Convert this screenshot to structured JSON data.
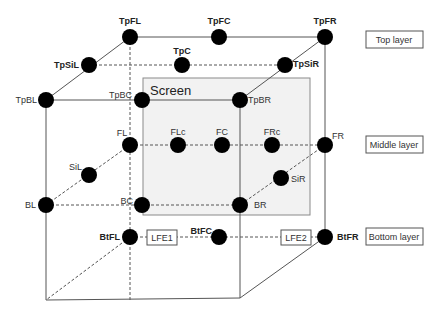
{
  "diagram": {
    "screen_label": "Screen",
    "layers": [
      {
        "id": "top",
        "label": "Top layer"
      },
      {
        "id": "middle",
        "label": "Middle layer"
      },
      {
        "id": "bottom",
        "label": "Bottom layer"
      }
    ],
    "speakers": {
      "TpFL": "TpFL",
      "TpFC": "TpFC",
      "TpFR": "TpFR",
      "TpSiL": "TpSiL",
      "TpC": "TpC",
      "TpSiR": "TpSiR",
      "TpBL": "TpBL",
      "TpBC": "TpBC",
      "TpBR": "TpBR",
      "FL": "FL",
      "FLc": "FLc",
      "FC": "FC",
      "FRc": "FRc",
      "FR": "FR",
      "SiL": "SiL",
      "SiR": "SiR",
      "BL": "BL",
      "BC": "BC",
      "BR": "BR",
      "BtFL": "BtFL",
      "BtFC": "BtFC",
      "BtFR": "BtFR"
    },
    "lfe": {
      "LFE1": "LFE1",
      "LFE2": "LFE2"
    }
  }
}
